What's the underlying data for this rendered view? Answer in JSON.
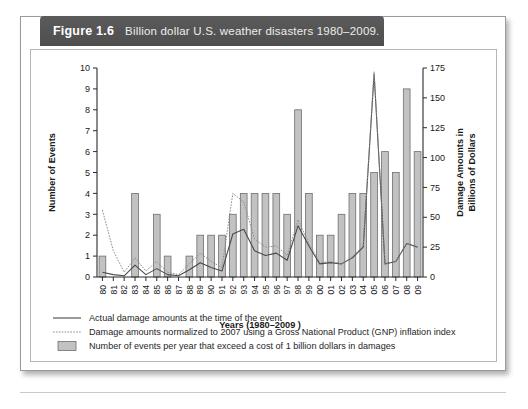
{
  "figure": {
    "number": "Figure 1.6",
    "caption": "Billion dollar U.S. weather disasters 1980–2009."
  },
  "chart_data": {
    "type": "bar",
    "title": "Billion dollar U.S. weather disasters 1980–2009.",
    "xlabel": "Years (1980–2009 )",
    "ylabel": "Number of Events",
    "y2label": "Damage Amounts in Billions of Dollars",
    "grid": false,
    "legend_position": "bottom",
    "ylim": [
      0,
      10
    ],
    "yticks": [
      0,
      1,
      2,
      3,
      4,
      5,
      6,
      7,
      8,
      9,
      10
    ],
    "y2lim": [
      0,
      175
    ],
    "y2ticks": [
      0,
      25,
      50,
      75,
      100,
      125,
      150,
      175
    ],
    "categories": [
      "80",
      "81",
      "82",
      "83",
      "84",
      "85",
      "86",
      "87",
      "88",
      "89",
      "90",
      "91",
      "92",
      "93",
      "94",
      "95",
      "96",
      "97",
      "98",
      "99",
      "00",
      "01",
      "02",
      "03",
      "04",
      "05",
      "06",
      "07",
      "08",
      "09"
    ],
    "x_full_years": [
      1980,
      1981,
      1982,
      1983,
      1984,
      1985,
      1986,
      1987,
      1988,
      1989,
      1990,
      1991,
      1992,
      1993,
      1994,
      1995,
      1996,
      1997,
      1998,
      1999,
      2000,
      2001,
      2002,
      2003,
      2004,
      2005,
      2006,
      2007,
      2008,
      2009
    ],
    "series": [
      {
        "name": "Number of events per year that exceed a cost of 1 billion dollars in damages",
        "type": "bar",
        "axis": "left",
        "units": "events",
        "values": [
          1,
          0,
          0,
          4,
          0,
          3,
          1,
          0,
          1,
          2,
          2,
          2,
          3,
          4,
          4,
          4,
          4,
          3,
          8,
          4,
          2,
          2,
          3,
          4,
          4,
          5,
          6,
          5,
          9,
          6
        ]
      },
      {
        "name": "Actual damage amounts at the time of the event",
        "type": "line",
        "style": "solid",
        "axis": "right",
        "units": "billions of dollars",
        "values": [
          4,
          2,
          1,
          10,
          2,
          7,
          2,
          1,
          6,
          12,
          8,
          5,
          36,
          40,
          22,
          18,
          20,
          14,
          43,
          26,
          11,
          12,
          11,
          16,
          25,
          170,
          11,
          13,
          28,
          25
        ]
      },
      {
        "name": "Damage amounts normalized to 2007 using a Gross National Product (GNP) inflation index",
        "type": "line",
        "style": "dotted",
        "axis": "right",
        "units": "billions of dollars (2007)",
        "values": [
          56,
          22,
          4,
          16,
          5,
          13,
          4,
          2,
          11,
          20,
          13,
          8,
          70,
          63,
          32,
          25,
          26,
          18,
          48,
          28,
          12,
          13,
          11,
          17,
          26,
          172,
          11,
          13,
          28,
          25
        ]
      }
    ],
    "legend": [
      {
        "marker": "solid-line",
        "label": "Actual damage amounts at the time of the event"
      },
      {
        "marker": "dotted-line",
        "label": "Damage amounts normalized to 2007 using a Gross National Product (GNP) inflation index"
      },
      {
        "marker": "bar-swatch",
        "label": "Number of events per year that exceed a cost of 1 billion dollars in damages"
      }
    ],
    "colors": {
      "bar_fill": "#c2c2c2",
      "bar_stroke": "#6f6f6f",
      "actual_line": "#4a4a4a",
      "normalized_line": "#8c8c8c",
      "axis": "#2a2a2a",
      "header_bar": "#545454"
    }
  }
}
